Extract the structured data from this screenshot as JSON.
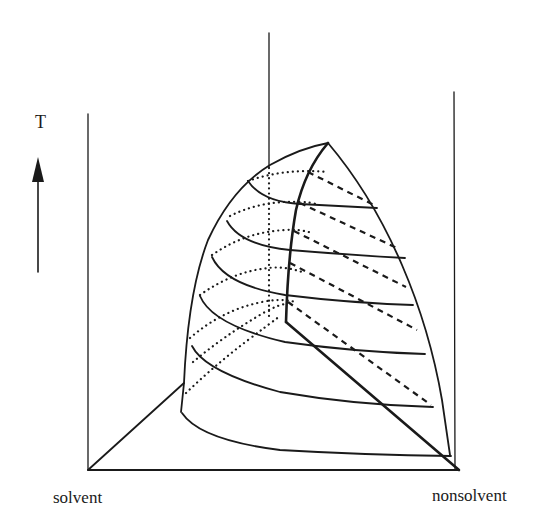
{
  "figure": {
    "axis_label": "T",
    "axis_direction": "up-arrow",
    "corner_labels": {
      "left": "solvent",
      "right": "nonsolvent"
    },
    "elements": {
      "frame_verticals": 3,
      "solid_isotherms": 6,
      "dashed_back_tie_lines": 5,
      "dotted_hidden_isotherms": 5,
      "critical_line": "heavy solid curve from apex down to back corner",
      "binary_edge": "heavy diagonal to nonsolvent corner"
    },
    "colors": {
      "ink": "#1a1a1a",
      "background": "#ffffff"
    }
  }
}
